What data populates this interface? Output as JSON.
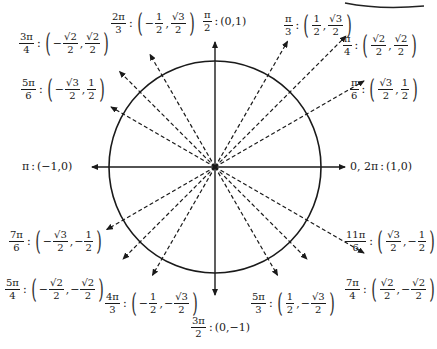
{
  "diagram": {
    "center": {
      "x": 215,
      "y": 167
    },
    "radius": 106,
    "axes": {
      "x_left": 92,
      "x_right": 345,
      "y_top": 42,
      "y_bottom": 295
    },
    "ray_length": 155,
    "corner_arc": true
  },
  "labels": {
    "pi_over_2": {
      "num": "π",
      "den": "2",
      "coords": "(0,1)"
    },
    "three_pi_over_2": {
      "num": "3π",
      "den": "2",
      "coords": "(0,−1)"
    },
    "pi": {
      "angle": "π",
      "coords": "(−1,0)"
    },
    "zero": {
      "angle": "0, 2π",
      "coords": "(1,0)"
    },
    "pi_over_3": {
      "num": "π",
      "den": "3",
      "x_sign": "",
      "x_num": "1",
      "x_den": "2",
      "y_sign": "",
      "y_num": "√3",
      "y_den": "2"
    },
    "pi_over_4": {
      "num": "π",
      "den": "4",
      "x_sign": "",
      "x_num": "√2",
      "x_den": "2",
      "y_sign": "",
      "y_num": "√2",
      "y_den": "2"
    },
    "pi_over_6": {
      "num": "π",
      "den": "6",
      "x_sign": "",
      "x_num": "√3",
      "x_den": "2",
      "y_sign": "",
      "y_num": "1",
      "y_den": "2"
    },
    "two_pi_over_3": {
      "num": "2π",
      "den": "3",
      "x_sign": "−",
      "x_num": "1",
      "x_den": "2",
      "y_sign": "",
      "y_num": "√3",
      "y_den": "2"
    },
    "three_pi_over_4": {
      "num": "3π",
      "den": "4",
      "x_sign": "−",
      "x_num": "√2",
      "x_den": "2",
      "y_sign": "",
      "y_num": "√2",
      "y_den": "2"
    },
    "five_pi_over_6": {
      "num": "5π",
      "den": "6",
      "x_sign": "−",
      "x_num": "√3",
      "x_den": "2",
      "y_sign": "",
      "y_num": "1",
      "y_den": "2"
    },
    "seven_pi_over_6": {
      "num": "7π",
      "den": "6",
      "x_sign": "−",
      "x_num": "√3",
      "x_den": "2",
      "y_sign": "−",
      "y_num": "1",
      "y_den": "2"
    },
    "five_pi_over_4": {
      "num": "5π",
      "den": "4",
      "x_sign": "−",
      "x_num": "√2",
      "x_den": "2",
      "y_sign": "−",
      "y_num": "√2",
      "y_den": "2"
    },
    "four_pi_over_3": {
      "num": "4π",
      "den": "3",
      "x_sign": "−",
      "x_num": "1",
      "x_den": "2",
      "y_sign": "−",
      "y_num": "√3",
      "y_den": "2"
    },
    "five_pi_over_3": {
      "num": "5π",
      "den": "3",
      "x_sign": "",
      "x_num": "1",
      "x_den": "2",
      "y_sign": "−",
      "y_num": "√3",
      "y_den": "2"
    },
    "seven_pi_over_4": {
      "num": "7π",
      "den": "4",
      "x_sign": "",
      "x_num": "√2",
      "x_den": "2",
      "y_sign": "−",
      "y_num": "√2",
      "y_den": "2"
    },
    "eleven_pi_over_6": {
      "num": "11π",
      "den": "6",
      "x_sign": "",
      "x_num": "√3",
      "x_den": "2",
      "y_sign": "−",
      "y_num": "1",
      "y_den": "2"
    }
  },
  "symbols": {
    "colon": ":",
    "lparen": "(",
    "rparen": ")",
    "comma": ","
  }
}
